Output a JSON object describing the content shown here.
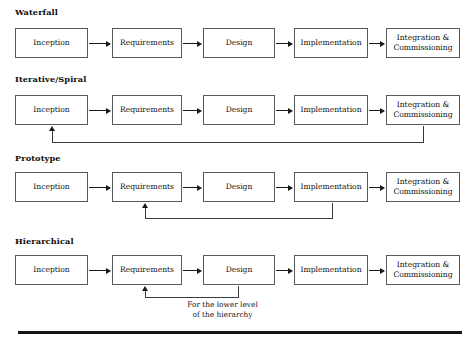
{
  "figure": {
    "stage_labels": {
      "inception": "Inception",
      "requirements": "Requirements",
      "design": "Design",
      "implementation": "Implementation",
      "integration_line1": "Integration &",
      "integration_line2": "Commissioning"
    },
    "rows": [
      {
        "id": "waterfall",
        "title": "Waterfall",
        "stages": [
          "Inception",
          "Requirements",
          "Design",
          "Implementation",
          "Integration & Commissioning"
        ],
        "feedback": null
      },
      {
        "id": "iterative-spiral",
        "title": "Iterative/Spiral",
        "stages": [
          "Inception",
          "Requirements",
          "Design",
          "Implementation",
          "Integration & Commissioning"
        ],
        "feedback": {
          "from": "Integration & Commissioning",
          "to": "Inception",
          "caption": null
        }
      },
      {
        "id": "prototype",
        "title": "Prototype",
        "stages": [
          "Inception",
          "Requirements",
          "Design",
          "Implementation",
          "Integration & Commissioning"
        ],
        "feedback": {
          "from": "Implementation",
          "to": "Requirements",
          "caption": null
        }
      },
      {
        "id": "hierarchical",
        "title": "Hierarchical",
        "stages": [
          "Inception",
          "Requirements",
          "Design",
          "Implementation",
          "Integration & Commissioning"
        ],
        "feedback": {
          "from": "Design",
          "to": "Requirements",
          "caption_line1": "For the lower level",
          "caption_line2": "of the hierarchy"
        }
      }
    ],
    "colors": {
      "box_border": "#5a5a5a",
      "arrow": "#1a1a1a",
      "text": "#111111",
      "rule": "#141414",
      "background": "#ffffff"
    }
  }
}
